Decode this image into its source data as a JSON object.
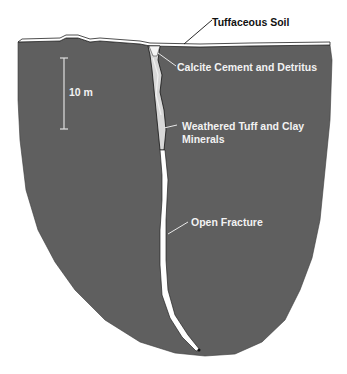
{
  "diagram": {
    "colors": {
      "rock": "#5f5f5f",
      "fill_light": "#ffffff",
      "soil": "#ffffff",
      "text_on_rock": "#f2f2f2",
      "text_outside": "#111111"
    },
    "labels": {
      "soil": "Tuffaceous Soil",
      "calcite": "Calcite Cement and Detritus",
      "weathered_line1": "Weathered Tuff and Clay",
      "weathered_line2": "Minerals",
      "fracture": "Open Fracture"
    },
    "scale_bar": {
      "label": "10 m"
    }
  }
}
